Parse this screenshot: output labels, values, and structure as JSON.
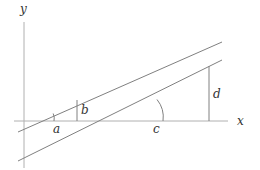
{
  "diagram": {
    "axes": {
      "x_label": "x",
      "y_label": "y"
    },
    "labels": {
      "a": "a",
      "b": "b",
      "c": "c",
      "d": "d"
    },
    "colors": {
      "line": "#808080",
      "axis": "#b0b0b0",
      "text": "#333333",
      "background": "#ffffff"
    }
  }
}
